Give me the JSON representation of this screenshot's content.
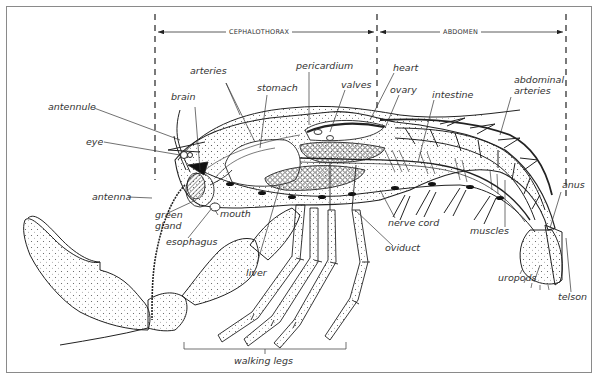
{
  "diagram": {
    "regions": [
      {
        "id": "cephalothorax",
        "label": "CEPHALOTHORAX"
      },
      {
        "id": "abdomen",
        "label": "ABDOMEN"
      }
    ],
    "labels": {
      "antennule": "antennule",
      "eye": "eye",
      "antenna": "antenna",
      "brain": "brain",
      "arteries": "arteries",
      "stomach": "stomach",
      "pericardium": "pericardium",
      "valves": "valves",
      "heart": "heart",
      "ovary": "ovary",
      "intestine": "intestine",
      "abdominal_arteries_1": "abdominal",
      "abdominal_arteries_2": "arteries",
      "anus": "anus",
      "green_gland_1": "green",
      "green_gland_2": "gland",
      "mouth": "mouth",
      "esophagus": "esophagus",
      "liver": "liver",
      "nerve_cord": "nerve cord",
      "oviduct": "oviduct",
      "muscles": "muscles",
      "uropods": "uropods",
      "telson": "telson",
      "walking_legs": "walking legs"
    }
  }
}
